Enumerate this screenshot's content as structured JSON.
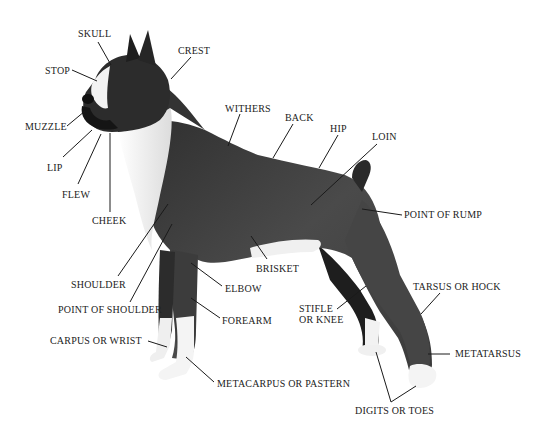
{
  "diagram": {
    "colors": {
      "coat_dark": "#3a3a3a",
      "coat_mid": "#555555",
      "white_marking": "#f2f2f2",
      "line": "#1a1a1a",
      "text": "#222222",
      "background": "#ffffff"
    },
    "labels": [
      {
        "id": "skull",
        "text": "SKULL",
        "x": 78,
        "y": 28
      },
      {
        "id": "crest",
        "text": "CREST",
        "x": 178,
        "y": 45
      },
      {
        "id": "stop",
        "text": "STOP",
        "x": 45,
        "y": 65
      },
      {
        "id": "withers",
        "text": "WITHERS",
        "x": 225,
        "y": 103
      },
      {
        "id": "back",
        "text": "BACK",
        "x": 285,
        "y": 112
      },
      {
        "id": "hip",
        "text": "HIP",
        "x": 330,
        "y": 123
      },
      {
        "id": "loin",
        "text": "LOIN",
        "x": 372,
        "y": 131
      },
      {
        "id": "muzzle",
        "text": "MUZZLE",
        "x": 25,
        "y": 121
      },
      {
        "id": "lip",
        "text": "LIP",
        "x": 47,
        "y": 162
      },
      {
        "id": "flew",
        "text": "FLEW",
        "x": 62,
        "y": 189
      },
      {
        "id": "cheek",
        "text": "CHEEK",
        "x": 92,
        "y": 215
      },
      {
        "id": "point_of_rump",
        "text": "POINT OF RUMP",
        "x": 404,
        "y": 209
      },
      {
        "id": "brisket",
        "text": "BRISKET",
        "x": 256,
        "y": 263
      },
      {
        "id": "shoulder",
        "text": "SHOULDER",
        "x": 71,
        "y": 279
      },
      {
        "id": "elbow",
        "text": "ELBOW",
        "x": 225,
        "y": 283
      },
      {
        "id": "stifle_or_knee",
        "text": "STIFLE\nOR KNEE",
        "x": 299,
        "y": 303
      },
      {
        "id": "tarsus_or_hock",
        "text": "TARSUS OR HOCK",
        "x": 413,
        "y": 281
      },
      {
        "id": "point_of_shoulder",
        "text": "POINT OF SHOULDER",
        "x": 58,
        "y": 304
      },
      {
        "id": "forearm",
        "text": "FOREARM",
        "x": 222,
        "y": 315
      },
      {
        "id": "carpus_or_wrist",
        "text": "CARPUS OR WRIST",
        "x": 50,
        "y": 335
      },
      {
        "id": "metatarsus",
        "text": "METATARSUS",
        "x": 455,
        "y": 348
      },
      {
        "id": "metacarpus_or_pastern",
        "text": "METACARPUS OR PASTERN",
        "x": 217,
        "y": 378
      },
      {
        "id": "digits_or_toes",
        "text": "DIGITS OR TOES",
        "x": 355,
        "y": 405
      }
    ],
    "leaders": [
      {
        "id": "skull",
        "x1": 98,
        "y1": 42,
        "x2": 111,
        "y2": 65
      },
      {
        "id": "crest",
        "x1": 191,
        "y1": 57,
        "x2": 171,
        "y2": 79
      },
      {
        "id": "stop",
        "x1": 72,
        "y1": 70,
        "x2": 97,
        "y2": 81
      },
      {
        "id": "withers",
        "x1": 240,
        "y1": 114,
        "x2": 228,
        "y2": 146
      },
      {
        "id": "back",
        "x1": 293,
        "y1": 124,
        "x2": 273,
        "y2": 158
      },
      {
        "id": "hip",
        "x1": 338,
        "y1": 135,
        "x2": 319,
        "y2": 168
      },
      {
        "id": "loin",
        "x1": 377,
        "y1": 144,
        "x2": 311,
        "y2": 205
      },
      {
        "id": "muzzle",
        "x1": 67,
        "y1": 126,
        "x2": 85,
        "y2": 111
      },
      {
        "id": "lip",
        "x1": 63,
        "y1": 157,
        "x2": 92,
        "y2": 130
      },
      {
        "id": "flew",
        "x1": 78,
        "y1": 184,
        "x2": 101,
        "y2": 134
      },
      {
        "id": "cheek",
        "x1": 110,
        "y1": 212,
        "x2": 110,
        "y2": 133
      },
      {
        "id": "point_of_rump",
        "x1": 402,
        "y1": 215,
        "x2": 362,
        "y2": 209
      },
      {
        "id": "brisket",
        "x1": 267,
        "y1": 259,
        "x2": 251,
        "y2": 236
      },
      {
        "id": "shoulder",
        "x1": 118,
        "y1": 276,
        "x2": 168,
        "y2": 204
      },
      {
        "id": "elbow",
        "x1": 222,
        "y1": 286,
        "x2": 191,
        "y2": 263
      },
      {
        "id": "stifle_or_knee",
        "x1": 337,
        "y1": 309,
        "x2": 366,
        "y2": 286
      },
      {
        "id": "tarsus_or_hock",
        "x1": 440,
        "y1": 293,
        "x2": 421,
        "y2": 314
      },
      {
        "id": "point_of_shoulder",
        "x1": 130,
        "y1": 302,
        "x2": 172,
        "y2": 224
      },
      {
        "id": "forearm",
        "x1": 220,
        "y1": 318,
        "x2": 191,
        "y2": 298
      },
      {
        "id": "carpus_or_wrist",
        "x1": 148,
        "y1": 341,
        "x2": 167,
        "y2": 347
      },
      {
        "id": "metatarsus",
        "x1": 450,
        "y1": 354,
        "x2": 428,
        "y2": 354
      },
      {
        "id": "metacarpus_or_pastern",
        "x1": 214,
        "y1": 382,
        "x2": 186,
        "y2": 357
      },
      {
        "id": "digits_or_toes_a",
        "x1": 391,
        "y1": 402,
        "x2": 376,
        "y2": 352
      },
      {
        "id": "digits_or_toes_b",
        "x1": 391,
        "y1": 402,
        "x2": 416,
        "y2": 386
      }
    ]
  }
}
